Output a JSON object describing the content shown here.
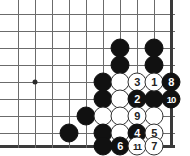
{
  "figure": {
    "kind": "go-board-diagram",
    "board_width_px": 190,
    "board_height_px": 156,
    "background_color": "#ffffff",
    "line_color": "#6b6b6b",
    "edge_color": "#3a3a3a",
    "black_color": "#111111",
    "white_color": "#ffffff"
  },
  "grid": {
    "x_positions": [
      18,
      35,
      52,
      69,
      86,
      103,
      120,
      137,
      154,
      171
    ],
    "y_positions": [
      14,
      31,
      48,
      65,
      82,
      99,
      116,
      133,
      146
    ],
    "right_edge_index": 9,
    "bottom_edge_index": 8,
    "spacing": 17,
    "star_points": [
      {
        "col": 1,
        "row": 4
      }
    ]
  },
  "stones": [
    {
      "col": 6,
      "row": 2,
      "color": "black",
      "label": ""
    },
    {
      "col": 8,
      "row": 2,
      "color": "black",
      "label": ""
    },
    {
      "col": 6,
      "row": 3,
      "color": "black",
      "label": ""
    },
    {
      "col": 8,
      "row": 3,
      "color": "black",
      "label": ""
    },
    {
      "col": 5,
      "row": 4,
      "color": "black",
      "label": ""
    },
    {
      "col": 6,
      "row": 4,
      "color": "white",
      "label": ""
    },
    {
      "col": 7,
      "row": 4,
      "color": "white",
      "label": "3"
    },
    {
      "col": 8,
      "row": 4,
      "color": "white",
      "label": "1"
    },
    {
      "col": 9,
      "row": 4,
      "color": "black",
      "label": "8"
    },
    {
      "col": 5,
      "row": 5,
      "color": "black",
      "label": ""
    },
    {
      "col": 6,
      "row": 5,
      "color": "white",
      "label": ""
    },
    {
      "col": 7,
      "row": 5,
      "color": "black",
      "label": "2"
    },
    {
      "col": 8,
      "row": 5,
      "color": "black",
      "label": ""
    },
    {
      "col": 9,
      "row": 5,
      "color": "black",
      "label": "10"
    },
    {
      "col": 4,
      "row": 6,
      "color": "black",
      "label": ""
    },
    {
      "col": 5,
      "row": 6,
      "color": "white",
      "label": ""
    },
    {
      "col": 6,
      "row": 6,
      "color": "white",
      "label": ""
    },
    {
      "col": 7,
      "row": 6,
      "color": "white",
      "label": "9"
    },
    {
      "col": 8,
      "row": 6,
      "color": "white",
      "label": ""
    },
    {
      "col": 3,
      "row": 7,
      "color": "black",
      "label": ""
    },
    {
      "col": 5,
      "row": 7,
      "color": "black",
      "label": ""
    },
    {
      "col": 6,
      "row": 7,
      "color": "white",
      "label": ""
    },
    {
      "col": 7,
      "row": 7,
      "color": "black",
      "label": "4"
    },
    {
      "col": 8,
      "row": 7,
      "color": "white",
      "label": "5"
    },
    {
      "col": 5,
      "row": 8,
      "color": "black",
      "label": ""
    },
    {
      "col": 6,
      "row": 8,
      "color": "black",
      "label": "6"
    },
    {
      "col": 7,
      "row": 8,
      "color": "white",
      "label": "11"
    },
    {
      "col": 8,
      "row": 8,
      "color": "white",
      "label": "7"
    }
  ]
}
